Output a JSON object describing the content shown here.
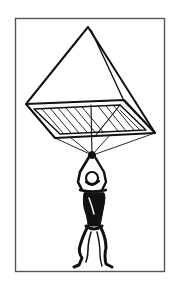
{
  "figure": {
    "colors": {
      "background": "#ffffff",
      "ink": "#111111",
      "frame": "#555555"
    }
  }
}
